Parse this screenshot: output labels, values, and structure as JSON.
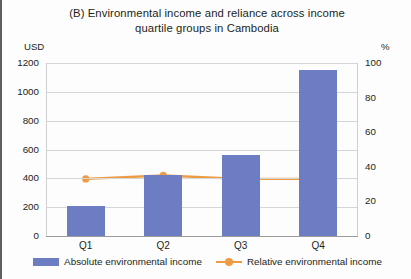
{
  "figure": {
    "title_line1": "(B) Environmental income and reliance across income",
    "title_line2": "quartile groups in Cambodia",
    "left_unit": "USD",
    "right_unit": "%"
  },
  "legend": {
    "items": [
      {
        "label": "Absolute environmental income",
        "marker": "bar-swatch",
        "color": "#6d7dc4"
      },
      {
        "label": "Relative environmental income",
        "marker": "line-marker-swatch",
        "color": "#ed9c43"
      }
    ]
  },
  "axes": {
    "left_ticks": [
      "1200",
      "1000",
      "800",
      "600",
      "400",
      "200",
      "0"
    ],
    "right_ticks": [
      "100",
      "80",
      "60",
      "40",
      "20",
      "0"
    ],
    "x_ticks": [
      "Q1",
      "Q2",
      "Q3",
      "Q4"
    ]
  },
  "chart_data": {
    "type": "bar",
    "title": "(B) Environmental income and reliance across income quartile groups in Cambodia",
    "categories": [
      "Q1",
      "Q2",
      "Q3",
      "Q4"
    ],
    "xlabel": "",
    "ylabel": "USD",
    "ylabel_secondary": "%",
    "ylim": [
      0,
      1200
    ],
    "ylim_secondary": [
      0,
      100
    ],
    "ytick_step": 200,
    "ytick_step_secondary": 20,
    "grid": true,
    "legend_position": "bottom",
    "series": [
      {
        "name": "Absolute environmental income",
        "type": "bar",
        "axis": "left",
        "unit": "USD",
        "color": "#6d7dc4",
        "values": [
          210,
          420,
          560,
          1150
        ]
      },
      {
        "name": "Relative environmental income",
        "type": "line",
        "axis": "right",
        "unit": "%",
        "color": "#ed9c43",
        "marker": "circle",
        "values": [
          33,
          35,
          33,
          33
        ]
      }
    ]
  }
}
